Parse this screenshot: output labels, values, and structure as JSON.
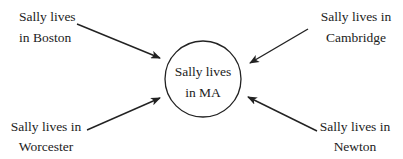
{
  "diagram": {
    "type": "hub-and-spoke inference diagram",
    "colors": {
      "stroke": "#222222",
      "text": "#222222",
      "background": "#ffffff"
    },
    "center": {
      "shape": "circle",
      "line1": "Sally lives",
      "line2": "in MA"
    },
    "nodes": [
      {
        "id": "boston",
        "position": "top-left",
        "line1": "Sally lives",
        "line2": "in Boston",
        "arrow": "points to center"
      },
      {
        "id": "cambridge",
        "position": "top-right",
        "line1": "Sally lives in",
        "line2": "Cambridge",
        "arrow": "points to center"
      },
      {
        "id": "worcester",
        "position": "bottom-left",
        "line1": "Sally lives in",
        "line2": "Worcester",
        "arrow": "points to center"
      },
      {
        "id": "newton",
        "position": "bottom-right",
        "line1": "Sally lives in",
        "line2": "Newton",
        "arrow": "points to center"
      }
    ]
  }
}
